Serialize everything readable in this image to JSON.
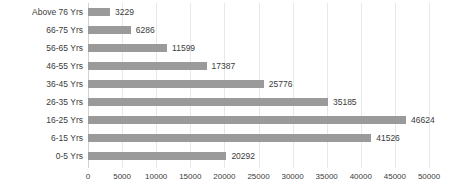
{
  "chart_data": {
    "type": "bar",
    "orientation": "horizontal",
    "title": "",
    "subtitle": "",
    "xlabel": "",
    "ylabel": "",
    "categories": [
      "Above 76 Yrs",
      "66-75 Yrs",
      "56-65 Yrs",
      "46-55 Yrs",
      "36-45 Yrs",
      "26-35 Yrs",
      "16-25 Yrs",
      "6-15 Yrs",
      "0-5 Yrs"
    ],
    "values": [
      3229,
      6286,
      11599,
      17387,
      25776,
      35185,
      46624,
      41526,
      20292
    ],
    "data_labels": [
      "3229",
      "6286",
      "11599",
      "17387",
      "25776",
      "35185",
      "46624",
      "41526",
      "20292"
    ],
    "xlim": [
      0,
      50000
    ],
    "xticks": [
      0,
      5000,
      10000,
      15000,
      20000,
      25000,
      30000,
      35000,
      40000,
      45000,
      50000
    ],
    "xtick_labels": [
      "0",
      "5000",
      "10000",
      "15000",
      "20000",
      "25000",
      "30000",
      "35000",
      "40000",
      "45000",
      "50000"
    ],
    "grid": true,
    "grid_axis": "x",
    "legend": false,
    "bar_color": "#9a9a9a",
    "grid_color": "#e8e8e8",
    "axis_color": "#d2d2d2",
    "text_color": "#3b3b3b",
    "background": "#ffffff"
  }
}
